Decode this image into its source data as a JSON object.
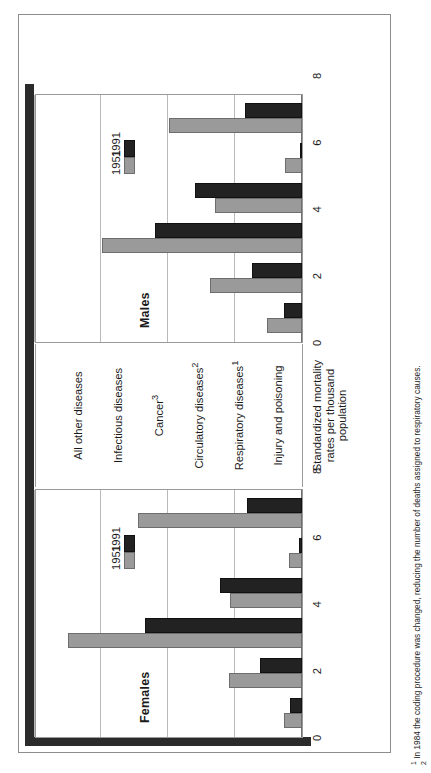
{
  "figure": {
    "panels": [
      {
        "key": "females",
        "title": "Females"
      },
      {
        "key": "males",
        "title": "Males"
      }
    ],
    "legend": {
      "items": [
        "1951",
        "1991"
      ]
    },
    "axis_caption": "Standardized mortality\nrates per thousand\npopulation",
    "footnotes": [
      "1 In 1984 the coding procedure was changed, reducing the number of deaths assigned to respiratory causes.",
      "2"
    ],
    "colors": {
      "series_1951": "#9a9a9a",
      "series_1991": "#222222",
      "grid": "#b9b9b9",
      "frame": "#8d8d8d"
    }
  },
  "chart_data": {
    "type": "bar",
    "title": "",
    "subtitle": "",
    "orientation": "back-to-back population pyramid, printed sideways",
    "categories": [
      "Injury and poisoning",
      "Respiratory diseases1",
      "Circulatory diseases2",
      "Cancer3",
      "Infectious diseases",
      "All other diseases"
    ],
    "panels": [
      "Females",
      "Males"
    ],
    "xlabel": "",
    "ylabel": "Standardized mortality rates per thousand population",
    "ylim": [
      0,
      8
    ],
    "yticks": [
      0,
      2,
      4,
      6,
      8
    ],
    "grid": true,
    "legend": [
      "1951",
      "1991"
    ],
    "legend_position": "inside, upper area of each panel",
    "series": [
      {
        "name": "Females 1951",
        "panel": "Females",
        "year": 1951,
        "values": [
          0.55,
          2.2,
          7.0,
          2.15,
          0.4,
          4.9
        ]
      },
      {
        "name": "Females 1991",
        "panel": "Females",
        "year": 1991,
        "values": [
          0.35,
          1.25,
          4.7,
          2.45,
          0.08,
          1.65
        ]
      },
      {
        "name": "Males 1951",
        "panel": "Males",
        "year": 1951,
        "values": [
          1.05,
          2.75,
          6.0,
          2.6,
          0.5,
          4.0
        ]
      },
      {
        "name": "Males 1991",
        "panel": "Males",
        "year": 1991,
        "values": [
          0.55,
          1.5,
          4.4,
          3.2,
          0.05,
          1.7
        ]
      }
    ],
    "annotations": [
      "1 In 1984 the coding procedure was changed, reducing the number of deaths assigned to respiratory causes."
    ]
  }
}
